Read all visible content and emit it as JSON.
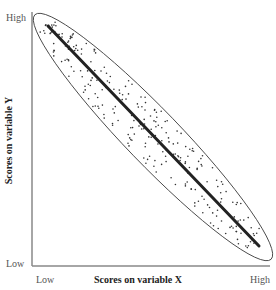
{
  "chart_data": {
    "type": "scatter",
    "title": "",
    "xlabel": "Scores on variable X",
    "ylabel": "Scores on variable Y",
    "x_tick_labels": [
      "Low",
      "High"
    ],
    "y_tick_labels": [
      "Low",
      "High"
    ],
    "grid": false,
    "legend": null,
    "relationship": "strong negative correlation",
    "annotations": [
      "ellipse enclosing data cloud",
      "regression line from top-left to bottom-right"
    ],
    "regression_line": {
      "start": {
        "x": "Low",
        "y": "High"
      },
      "end": {
        "x": "High",
        "y": "Low"
      }
    },
    "colors": {
      "points": "#333333",
      "line": "#222222",
      "ellipse": "#444444",
      "axis": "#888888"
    }
  },
  "axes": {
    "x_title": "Scores on variable X",
    "y_title": "Scores on variable Y",
    "x_low": "Low",
    "x_high": "High",
    "y_low": "Low",
    "y_high": "High"
  }
}
